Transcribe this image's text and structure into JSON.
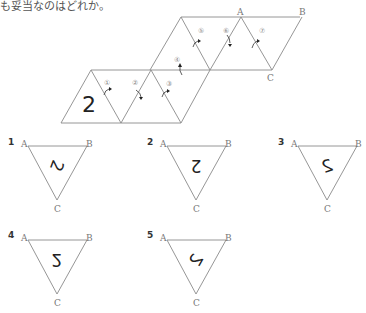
{
  "question": {
    "text_fragment": "も妥当なのはどれか。"
  },
  "net": {
    "face_digit": "2",
    "vertex_labels": {
      "a": "A",
      "b": "B",
      "c": "C"
    },
    "fold_markers": [
      "①",
      "②",
      "③",
      "④",
      "⑤",
      "⑥",
      "⑦"
    ]
  },
  "options": [
    {
      "number": "1",
      "vertex_a": "A",
      "vertex_b": "B",
      "vertex_c": "C",
      "glyph": "2",
      "rotation_deg": 110,
      "mirrored": false
    },
    {
      "number": "2",
      "vertex_a": "A",
      "vertex_b": "B",
      "vertex_c": "C",
      "glyph": "2",
      "rotation_deg": 180,
      "mirrored": false
    },
    {
      "number": "3",
      "vertex_a": "A",
      "vertex_b": "B",
      "vertex_c": "C",
      "glyph": "2",
      "rotation_deg": -20,
      "mirrored": true
    },
    {
      "number": "4",
      "vertex_a": "A",
      "vertex_b": "B",
      "vertex_c": "C",
      "glyph": "2",
      "rotation_deg": 180,
      "mirrored": true
    },
    {
      "number": "5",
      "vertex_a": "A",
      "vertex_b": "B",
      "vertex_c": "C",
      "glyph": "2",
      "rotation_deg": -60,
      "mirrored": true
    }
  ]
}
